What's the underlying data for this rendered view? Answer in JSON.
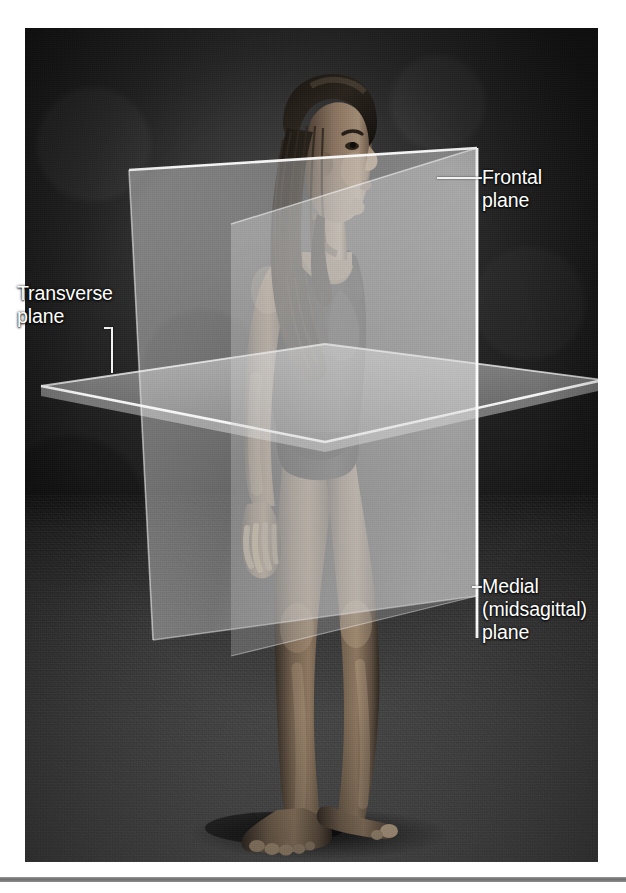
{
  "figure": {
    "kind": "anatomical-photograph",
    "subject": {
      "pose": "standing, head turned to the right in profile, arms at sides",
      "hair": "long braided hair",
      "clothing": "dark sleeveless leotard"
    },
    "planes": [
      {
        "id": "frontal",
        "name": "Frontal plane",
        "orientation": "coronal, vertical, divides body into anterior and posterior"
      },
      {
        "id": "transverse",
        "name": "Transverse plane",
        "orientation": "horizontal, divides body into superior and inferior"
      },
      {
        "id": "medial",
        "name": "Medial (midsagittal) plane",
        "orientation": "vertical, divides body into equal left and right halves"
      }
    ]
  },
  "labels": {
    "frontal": "Frontal\nplane",
    "transverse": "Transverse\nplane",
    "medial": "Medial\n(midsagittal)\nplane"
  },
  "colors": {
    "label_text": "#ffffff",
    "leader_line": "#f2f2f2",
    "plane_tint": "#c9c9c9",
    "plane_edge": "#ffffff",
    "page_background": "#ffffff",
    "photo_background": "#1d1d1d",
    "bottom_rule": "#7a7a7a"
  }
}
